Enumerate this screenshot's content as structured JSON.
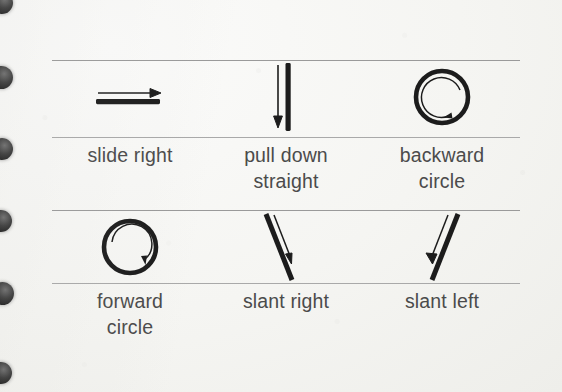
{
  "page": {
    "kind": "scanned-notebook-page",
    "paper_color": "#f6f6f4",
    "ink_color": "#1c1c1c",
    "rule_color": "#9a9a9a",
    "text_color": "#4b4b4b",
    "binding_hole_color": "#1d1d1d",
    "binding_holes": 6
  },
  "table": {
    "rows": [
      {
        "cells": [
          {
            "icon": "arrow-right-over-bar-icon",
            "label_line1": "slide right",
            "label_line2": ""
          },
          {
            "icon": "arrow-down-beside-bar-icon",
            "label_line1": "pull down",
            "label_line2": "straight"
          },
          {
            "icon": "counterclockwise-circle-icon",
            "label_line1": "backward",
            "label_line2": "circle"
          }
        ]
      },
      {
        "cells": [
          {
            "icon": "clockwise-circle-icon",
            "label_line1": "forward",
            "label_line2": "circle"
          },
          {
            "icon": "diagonal-stroke-down-right-icon",
            "label_line1": "slant right",
            "label_line2": ""
          },
          {
            "icon": "diagonal-stroke-down-left-icon",
            "label_line1": "slant left",
            "label_line2": ""
          }
        ]
      }
    ]
  }
}
